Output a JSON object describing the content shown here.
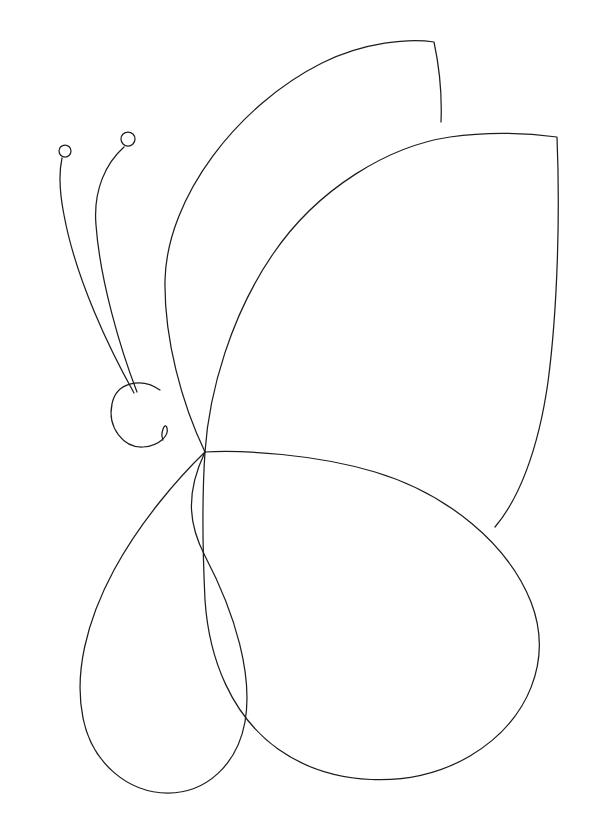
{
  "document": {
    "title": "Butterfly Line Drawing",
    "subject": "butterfly",
    "style": "line-art outline, coloring-page",
    "orientation": "portrait",
    "canvas_width_px": 594,
    "canvas_height_px": 835,
    "background_color": "#ffffff",
    "stroke_color": "#1d1d1d",
    "stroke_width_px": 1.25,
    "fill": "none",
    "text_content": "",
    "shape_count": 7
  },
  "drawing": {
    "parts": [
      {
        "id": "head",
        "label": "Head",
        "kind": "spiral-circle",
        "center": [
          141,
          411
        ],
        "radius": 29,
        "note": "circle opening into an inward spiral tail at lower right"
      },
      {
        "id": "antenna-left",
        "label": "Left antenna",
        "kind": "curve-with-knob",
        "from": [
          134,
          393
        ],
        "to": [
          66,
          158
        ],
        "knob_center": [
          65,
          151
        ],
        "knob_radius": 6
      },
      {
        "id": "antenna-right",
        "label": "Right antenna",
        "kind": "curve-with-knob",
        "from": [
          136,
          392
        ],
        "to": [
          126,
          146
        ],
        "knob_center": [
          128,
          139
        ],
        "knob_radius": 7
      },
      {
        "id": "upper-wing-back",
        "label": "Upper back wing",
        "kind": "closed-wing",
        "anchor": [
          205,
          452
        ],
        "apex": [
          434,
          42
        ],
        "tip": [
          441,
          122
        ]
      },
      {
        "id": "upper-wing-front",
        "label": "Upper front wing",
        "kind": "closed-wing",
        "anchor": [
          205,
          452
        ],
        "apex": [
          557,
          137
        ],
        "tip": [
          495,
          527
        ]
      },
      {
        "id": "lower-wing-large",
        "label": "Lower large wing",
        "kind": "closed-wing",
        "anchor": [
          205,
          452
        ],
        "rightmost": [
          538,
          635
        ],
        "bottom": [
          392,
          776
        ]
      },
      {
        "id": "lower-wing-small",
        "label": "Lower small wing",
        "kind": "closed-wing",
        "anchor": [
          205,
          452
        ],
        "leftmost": [
          79,
          620
        ],
        "bottom": [
          196,
          793
        ]
      }
    ],
    "junction_point": [
      205,
      452
    ],
    "body_symmetry": "single-side (right-facing) profile"
  },
  "paths": {
    "head": "M 160,390 C 142,377 116,382 112,404 C 107,428 124,448 143,447 C 160,446 169,435 167,428 C 165,421 160,433 163,440",
    "antenna_left": "M 134,393 C 110,350 76,280 64,215 C 59,190 59,172 62,158",
    "antenna_right": "M 137,392 C 120,348 100,280 96,225 C 93,190 106,163 124,147",
    "upper_wing_back": "M 205,452 C 182,404 164,339 165,280 C 167,197 238,105 322,63 C 364,42 410,38 434,42 C 440,70 442,98 441,122",
    "upper_wing_front": "M 205,452 C 209,392 231,315 273,254 C 318,188 389,146 450,137 C 492,131 534,134 557,137 C 560,210 558,306 548,382 C 538,452 518,500 495,527",
    "lower_wing_large": "M 205,452 C 243,450 315,454 375,472 C 448,494 508,544 531,602 C 553,659 530,720 470,756 C 410,791 330,786 278,749 C 232,716 209,660 205,600 C 202,538 203,482 205,452",
    "lower_wing_small": "M 205,452 C 178,478 140,522 114,570 C 86,622 74,674 83,718 C 92,763 128,793 168,793 C 206,793 237,765 245,722 C 253,676 236,615 205,556 C 190,527 184,496 205,452"
  },
  "palette": {
    "background": "#ffffff",
    "ink": "#1d1d1d"
  }
}
